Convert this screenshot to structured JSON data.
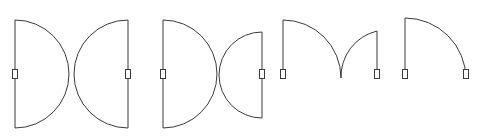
{
  "document": {
    "title": "Door Swing Symbols",
    "kind": "architectural-floor-plan-symbol-set",
    "width": 485,
    "height": 140,
    "background_color": "#ffffff",
    "line_color": "#3a3a3a",
    "line_width": 1
  },
  "style": {
    "stroke": "#3a3a3a",
    "stroke_width": 1,
    "hinge_fill": "#ffffff",
    "hinge_stroke": "#3a3a3a",
    "hinge_width": 5,
    "hinge_height": 9
  },
  "symbols": [
    {
      "name": "double-door-full-swing-wide",
      "label": "Double door, opposed semicircular swings",
      "leaf_count": 2,
      "leaves": [
        {
          "name": "left-leaf",
          "jamb": {
            "x": 15,
            "y1": 20,
            "y2": 128
          },
          "hinge": {
            "x": 15,
            "y": 74
          },
          "arc": {
            "d": "M 15 20 A 54 54 0 0 1 15 128"
          },
          "radius": 54,
          "sweep_degrees": 180,
          "swing_direction": "right"
        },
        {
          "name": "right-leaf",
          "jamb": {
            "x": 128,
            "y1": 20,
            "y2": 128
          },
          "hinge": {
            "x": 128,
            "y": 74
          },
          "arc": {
            "d": "M 128 20 A 54 54 0 0 0 128 128"
          },
          "radius": 54,
          "sweep_degrees": 180,
          "swing_direction": "left"
        }
      ]
    },
    {
      "name": "double-door-full-swing-unequal",
      "label": "Double door, unequal opposed semicircular swings",
      "leaf_count": 2,
      "leaves": [
        {
          "name": "left-leaf",
          "jamb": {
            "x": 163,
            "y1": 20,
            "y2": 128
          },
          "hinge": {
            "x": 163,
            "y": 74
          },
          "arc": {
            "d": "M 163 20 A 54 54 0 0 1 163 128"
          },
          "radius": 54,
          "sweep_degrees": 180,
          "swing_direction": "right"
        },
        {
          "name": "right-leaf",
          "jamb": {
            "x": 262,
            "y1": 32,
            "y2": 118
          },
          "hinge": {
            "x": 262,
            "y": 74
          },
          "arc": {
            "d": "M 262 32 A 43 43 0 0 0 262 118"
          },
          "radius": 43,
          "sweep_degrees": 180,
          "swing_direction": "left"
        }
      ]
    },
    {
      "name": "double-door-quarter-swing",
      "label": "Double door, quarter-circle swings meeting at centre",
      "leaf_count": 2,
      "leaves": [
        {
          "name": "left-leaf",
          "jamb": {
            "x": 283,
            "y1": 20,
            "y2": 79
          },
          "hinge": {
            "x": 283,
            "y": 74
          },
          "arc": {
            "d": "M 283 20 A 58 58 0 0 1 341 78"
          },
          "radius": 58,
          "sweep_degrees": 90,
          "swing_direction": "right"
        },
        {
          "name": "right-leaf",
          "jamb": {
            "x": 377,
            "y1": 31,
            "y2": 79
          },
          "hinge": {
            "x": 377,
            "y": 74
          },
          "arc": {
            "d": "M 377 31 A 47 47 0 0 0 341 78"
          },
          "radius": 47,
          "sweep_degrees": 90,
          "swing_direction": "left"
        }
      ]
    },
    {
      "name": "single-door-quarter-swing",
      "label": "Single door, quarter-circle swing",
      "leaf_count": 1,
      "leaves": [
        {
          "name": "single-leaf",
          "jamb": {
            "x": 405,
            "y1": 18,
            "y2": 79
          },
          "hinge": {
            "x": 405,
            "y": 74
          },
          "second_hinge": {
            "x": 466,
            "y": 74
          },
          "arc": {
            "d": "M 405 18 A 61 61 0 0 1 466 79"
          },
          "radius": 61,
          "sweep_degrees": 90,
          "swing_direction": "right"
        }
      ]
    }
  ]
}
